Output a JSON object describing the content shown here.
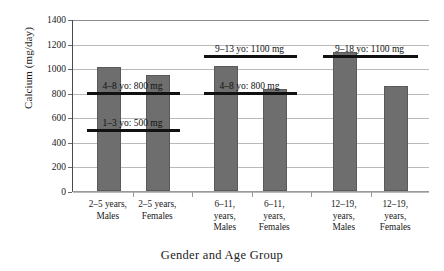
{
  "chart_data": {
    "type": "bar",
    "title": "",
    "xlabel": "Gender and Age Group",
    "ylabel": "Calcium (mg/day)",
    "ylim": [
      0,
      1400
    ],
    "ytick_step": 200,
    "yticks": [
      "1400",
      "1200",
      "1000",
      "800",
      "600",
      "400",
      "200",
      "0"
    ],
    "grid": true,
    "legend": "none",
    "categories": [
      "2–5 years,\nMales",
      "2–5 years,\nFemales",
      "6–11,\nyears,\nMales",
      "6–11,\nyears,\nFemales",
      "12–19,\nyears,\nMales",
      "12–19,\nyears,\nFemales"
    ],
    "values": [
      1010,
      945,
      1020,
      830,
      1130,
      855
    ],
    "bar_color": "#6e6e6e",
    "annotations": [
      {
        "label": "1–3 yo: 500 mg",
        "value": 500,
        "span_categories": [
          0,
          1
        ]
      },
      {
        "label": "4–8 yo: 800 mg",
        "value": 800,
        "span_categories": [
          0,
          1
        ]
      },
      {
        "label": "4–8 yo: 800 mg",
        "value": 800,
        "span_categories": [
          2,
          3
        ]
      },
      {
        "label": "9–13 yo: 1100 mg",
        "value": 1100,
        "span_categories": [
          2,
          3
        ]
      },
      {
        "label": "9–18 yo: 1100 mg",
        "value": 1100,
        "span_categories": [
          4,
          5
        ]
      }
    ],
    "annotation_color": "#111111"
  }
}
